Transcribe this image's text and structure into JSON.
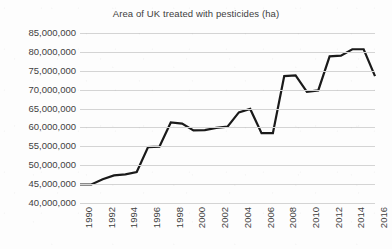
{
  "chart_data": {
    "type": "line",
    "title": "Area of UK treated with pesticides (ha)",
    "xlabel": "",
    "ylabel": "",
    "ylim": [
      40000000,
      85000000
    ],
    "ytick_step": 5000000,
    "yticks": [
      85000000,
      80000000,
      75000000,
      70000000,
      65000000,
      60000000,
      55000000,
      50000000,
      45000000,
      40000000
    ],
    "ytick_labels": [
      "85,000,000",
      "80,000,000",
      "75,000,000",
      "70,000,000",
      "65,000,000",
      "60,000,000",
      "55,000,000",
      "50,000,000",
      "45,000,000",
      "40,000,000"
    ],
    "xlim": [
      1990,
      2016
    ],
    "xtick_step": 2,
    "xtick_labels": [
      "1990",
      "1992",
      "1994",
      "1996",
      "1998",
      "2000",
      "2002",
      "2004",
      "2006",
      "2008",
      "2010",
      "2012",
      "2014",
      "2016"
    ],
    "x": [
      1990,
      1991,
      1992,
      1993,
      1994,
      1995,
      1996,
      1997,
      1998,
      1999,
      2000,
      2001,
      2002,
      2003,
      2004,
      2005,
      2006,
      2007,
      2008,
      2009,
      2010,
      2011,
      2012,
      2013,
      2014,
      2015,
      2016
    ],
    "values": [
      44900000,
      44900000,
      46300000,
      47300000,
      47600000,
      48200000,
      54800000,
      54900000,
      61300000,
      61000000,
      59200000,
      59300000,
      59900000,
      60200000,
      64000000,
      64900000,
      58500000,
      58500000,
      73600000,
      73800000,
      69400000,
      69800000,
      78800000,
      79000000,
      80700000,
      80700000,
      73600000
    ],
    "series": [
      {
        "name": "Area of UK treated with pesticides (ha)",
        "values": [
          44900000,
          44900000,
          46300000,
          47300000,
          47600000,
          48200000,
          54800000,
          54900000,
          61300000,
          61000000,
          59200000,
          59300000,
          59900000,
          60200000,
          64000000,
          64900000,
          58500000,
          58500000,
          73600000,
          73800000,
          69400000,
          69800000,
          78800000,
          79000000,
          80700000,
          80700000,
          73600000
        ],
        "color": "#1a1a1a",
        "line_width": 2.2
      }
    ],
    "grid": true,
    "grid_axis": "y",
    "grid_color": "#d4d4d4",
    "legend": false,
    "legend_position": "none",
    "background_color": "#fdfdfd",
    "text_color": "#3f3f3f"
  }
}
